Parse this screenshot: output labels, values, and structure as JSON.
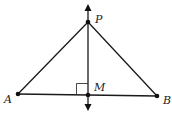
{
  "diagram": {
    "colors": {
      "stroke": "#1a1a1a",
      "point": "#111111",
      "label": "#222222",
      "background": "#ffffff"
    },
    "points": {
      "P": {
        "label": "P",
        "x": 88,
        "y": 22
      },
      "M": {
        "label": "M",
        "x": 88,
        "y": 95
      },
      "A": {
        "label": "A",
        "x": 18,
        "y": 94
      },
      "B": {
        "label": "B",
        "x": 157,
        "y": 96
      }
    },
    "segments": [
      {
        "from": "A",
        "to": "P"
      },
      {
        "from": "P",
        "to": "B"
      },
      {
        "from": "A",
        "to": "B"
      }
    ],
    "lines": [
      {
        "name": "perpendicular-line-PM",
        "through": [
          "P",
          "M"
        ],
        "arrows": "both"
      }
    ],
    "marks": [
      {
        "type": "right-angle",
        "at": "M"
      }
    ]
  }
}
